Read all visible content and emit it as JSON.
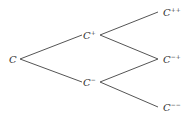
{
  "diagram": {
    "type": "binomial-tree",
    "line_color": "#555555",
    "text_color": "#333333",
    "nodes": [
      {
        "id": "root",
        "base": "C",
        "sup": "",
        "x": 9,
        "y": 54
      },
      {
        "id": "up",
        "base": "C",
        "sup": "+",
        "x": 83,
        "y": 30
      },
      {
        "id": "down",
        "base": "C",
        "sup": "−",
        "x": 83,
        "y": 77
      },
      {
        "id": "upup",
        "base": "C",
        "sup": "++",
        "x": 163,
        "y": 7
      },
      {
        "id": "downup",
        "base": "C",
        "sup": "−+",
        "x": 163,
        "y": 54
      },
      {
        "id": "downdown",
        "base": "C",
        "sup": "−−",
        "x": 163,
        "y": 102
      }
    ],
    "edges": [
      {
        "from": "root",
        "to": "up"
      },
      {
        "from": "root",
        "to": "down"
      },
      {
        "from": "up",
        "to": "upup"
      },
      {
        "from": "up",
        "to": "downup"
      },
      {
        "from": "down",
        "to": "downup"
      },
      {
        "from": "down",
        "to": "downdown"
      }
    ]
  }
}
